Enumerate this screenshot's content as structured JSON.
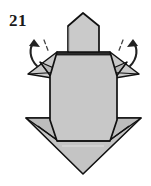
{
  "figure": {
    "step_number": "21",
    "colors": {
      "paper_light": "#cccccc",
      "paper_mid": "#c2c2c2",
      "paper_shade": "#b5b5b5",
      "paper_dark": "#a8a8a8",
      "outline": "#111111",
      "crease": "#555555",
      "arrow": "#222222",
      "background": "#ffffff",
      "highlight": "#dcdcdc"
    },
    "annotations": {
      "left_arrow_name": "fold-arrow-left",
      "right_arrow_name": "fold-arrow-right",
      "left_dash_name": "fold-guide-dash-left",
      "right_dash_name": "fold-guide-dash-right"
    },
    "shapes": {
      "head": "68,14 82,14 100,25 100,52 68,52",
      "head_outline": "68,25 83,13 99,25 99,52 68,52",
      "neck_band": "68,49 99,49 99,55 68,55",
      "body": "56,55 111,55 117,76 117,118 112,142 55,142 50,118 50,76",
      "bottom_triangle": "26,118 141,118 83,174",
      "left_shoulder_flap": "28,74 56,53 63,73 50,77",
      "right_shoulder_flap": "139,74 111,53 104,73 117,77",
      "left_bottom_flap": "26,118 55,142 50,118",
      "right_bottom_flap": "141,118 112,142 117,118"
    }
  }
}
